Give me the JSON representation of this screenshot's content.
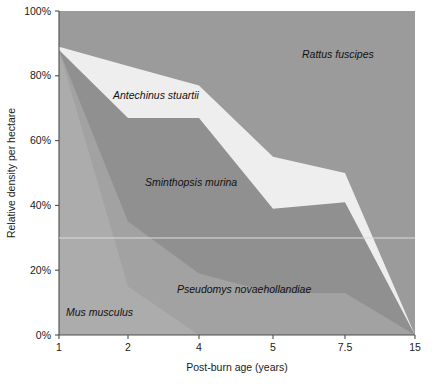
{
  "chart_data": {
    "type": "area",
    "title": "",
    "subtitle": "",
    "xlabel": "Post-burn age (years)",
    "ylabel": "Relative density per hectare",
    "categories": [
      "1",
      "2",
      "4",
      "5",
      "7.5",
      "15"
    ],
    "x": [
      1,
      2,
      4,
      5,
      7.5,
      15
    ],
    "xlim": [
      1,
      15
    ],
    "ylim": [
      0,
      100
    ],
    "x_tick_labels": [
      "1",
      "2",
      "4",
      "5",
      "7.5",
      "15"
    ],
    "y_tick_labels": [
      "0%",
      "20%",
      "40%",
      "60%",
      "80%",
      "100%"
    ],
    "y_ticks": [
      0,
      20,
      40,
      60,
      80,
      100
    ],
    "grid": false,
    "legend_position": "inline-annotations",
    "stacked": true,
    "stack_order_top_to_bottom": [
      "Rattus fuscipes",
      "Antechinus stuartii",
      "Sminthopsis murina",
      "Pseudomys novaehollandiae",
      "Mus musculus"
    ],
    "note": "Values are cumulative upper boundaries (percent) of each stacked band, read bottom-up.",
    "series": [
      {
        "name": "Mus musculus",
        "color": "#acacac",
        "cumulative_top": [
          88,
          15,
          0,
          0,
          0,
          0
        ],
        "values": [
          88,
          15,
          0,
          0,
          0,
          0
        ]
      },
      {
        "name": "Pseudomys novaehollandiae",
        "color": "#a2a2a2",
        "cumulative_top": [
          88,
          35,
          19,
          13,
          13,
          0
        ],
        "values": [
          0,
          20,
          19,
          13,
          13,
          0
        ]
      },
      {
        "name": "Sminthopsis murina",
        "color": "#909090",
        "cumulative_top": [
          88,
          67,
          67,
          39,
          41,
          0
        ],
        "values": [
          0,
          32,
          48,
          26,
          28,
          0
        ]
      },
      {
        "name": "Antechinus stuartii",
        "color": "#eeeeee",
        "cumulative_top": [
          89,
          83,
          77,
          55,
          50,
          0
        ],
        "values": [
          1,
          16,
          10,
          16,
          9,
          0
        ]
      },
      {
        "name": "Rattus fuscipes",
        "color": "#9b9b9b",
        "cumulative_top": [
          100,
          100,
          100,
          100,
          100,
          100
        ],
        "values": [
          11,
          17,
          23,
          45,
          50,
          100
        ]
      }
    ],
    "annotations": [
      {
        "label": "Rattus fuscipes",
        "x_px": 302,
        "y_px": 58
      },
      {
        "label": "Antechinus stuartii",
        "x_px": 113,
        "y_px": 99
      },
      {
        "label": "Sminthopsis murina",
        "x_px": 145,
        "y_px": 186
      },
      {
        "label": "Pseudomys novaehollandiae",
        "x_px": 177,
        "y_px": 293
      },
      {
        "label": "Mus musculus",
        "x_px": 66,
        "y_px": 316
      }
    ],
    "guide_line": {
      "description": "faint light horizontal reference line near 30%",
      "y_value": 30,
      "color": "#d8d8d8"
    },
    "colors": {
      "rattus": "#9b9b9b",
      "antechinus": "#eeeeee",
      "sminthopsis": "#909090",
      "pseudomys": "#a2a2a2",
      "mus": "#acacac",
      "axis": "#4d4d4d",
      "text": "#1a1a1a"
    }
  }
}
